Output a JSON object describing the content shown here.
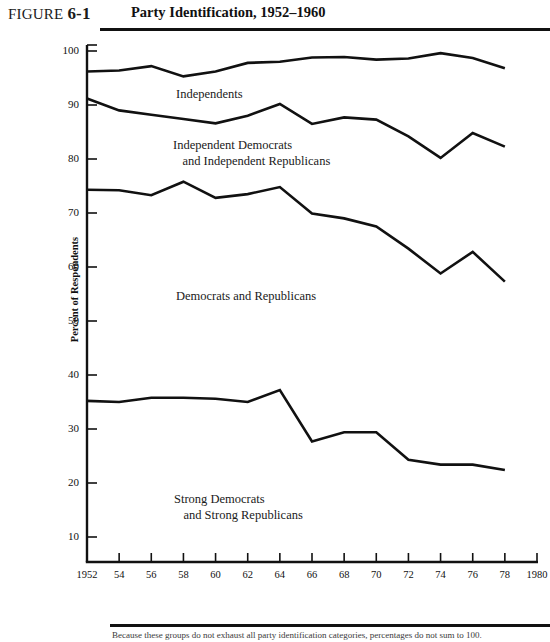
{
  "header": {
    "figure_label": "FIGURE",
    "figure_number": "6-1",
    "title": "Party Identification, 1952–1960"
  },
  "footer": {
    "source_note": "Because these groups do not exhaust all party identification categories, percentages do not sum to 100."
  },
  "chart_data": {
    "type": "line",
    "title": "Party Identification, 1952–1960",
    "xlabel": "",
    "ylabel": "Percent of Respondents",
    "xlim": [
      1952,
      1980
    ],
    "ylim": [
      0,
      100
    ],
    "ytick_labels": [
      "100",
      "90",
      "80",
      "70",
      "60",
      "50",
      "40",
      "30",
      "20",
      "10"
    ],
    "ytick_values": [
      100,
      90,
      80,
      70,
      60,
      50,
      40,
      30,
      20,
      10
    ],
    "xtick_labels": [
      "1952",
      "54",
      "56",
      "58",
      "60",
      "62",
      "64",
      "66",
      "68",
      "70",
      "72",
      "74",
      "76",
      "78",
      "1980"
    ],
    "xtick_values": [
      1952,
      1954,
      1956,
      1958,
      1960,
      1962,
      1964,
      1966,
      1968,
      1970,
      1972,
      1974,
      1976,
      1978,
      1980
    ],
    "grid": false,
    "legend_position": "inline-annotations",
    "x": [
      1952,
      1954,
      1956,
      1958,
      1960,
      1962,
      1964,
      1966,
      1968,
      1970,
      1972,
      1974,
      1976,
      1978
    ],
    "series": [
      {
        "name": "Independents",
        "label_lines": [
          "Independents"
        ],
        "label_x": 176,
        "label_y": 86,
        "values": [
          96.2,
          96.4,
          97.2,
          95.3,
          96.2,
          97.8,
          98.0,
          98.8,
          98.9,
          98.4,
          98.6,
          99.6,
          98.7,
          96.8
        ]
      },
      {
        "name": "Independent Democrats and Independent Republicans",
        "label_lines": [
          "Independent Democrats",
          "   and Independent Republicans"
        ],
        "label_x": 173,
        "label_y": 137,
        "values": [
          91.2,
          89.0,
          88.2,
          87.4,
          86.6,
          88.0,
          90.2,
          86.5,
          87.7,
          87.3,
          84.2,
          80.2,
          84.8,
          82.3
        ]
      },
      {
        "name": "Democrats and Republicans",
        "label_lines": [
          "Democrats and Republicans"
        ],
        "label_x": 176,
        "label_y": 288,
        "values": [
          74.3,
          74.2,
          73.3,
          75.8,
          72.8,
          73.5,
          74.8,
          69.9,
          69.0,
          67.5,
          63.4,
          58.8,
          62.8,
          57.3
        ]
      },
      {
        "name": "Strong Democrats and Strong Republicans",
        "label_lines": [
          "Strong Democrats",
          "   and Strong Republicans"
        ],
        "label_x": 174,
        "label_y": 491,
        "values": [
          35.2,
          35.0,
          35.8,
          35.8,
          35.6,
          35.0,
          37.2,
          27.7,
          29.4,
          29.4,
          24.3,
          23.4,
          23.4,
          22.4
        ]
      }
    ],
    "colors": {
      "line": "#111111",
      "axis": "#111111",
      "background": "#ffffff",
      "text": "#1a1a1a"
    }
  }
}
